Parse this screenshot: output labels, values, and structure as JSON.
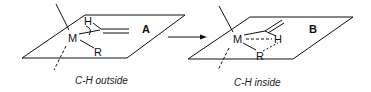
{
  "diagram": {
    "left": {
      "label": "A",
      "caption": "C-H outside",
      "atoms": {
        "metal": "M",
        "hydrogen": "H",
        "group": "R"
      }
    },
    "right": {
      "label": "B",
      "caption": "C-H inside",
      "atoms": {
        "metal": "M",
        "hydrogen": "H",
        "group": "R"
      }
    },
    "arrow": "reaction-arrow"
  }
}
